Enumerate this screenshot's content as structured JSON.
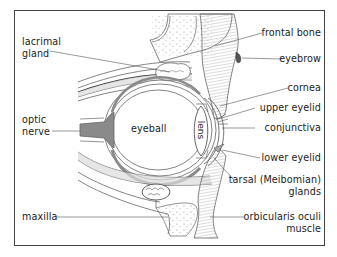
{
  "diagram": {
    "labels_left": [
      {
        "id": "lacrimal-gland",
        "line1": "lacrimal",
        "line2": "gland"
      },
      {
        "id": "optic-nerve",
        "line1": "optic",
        "line2": "nerve"
      },
      {
        "id": "maxilla",
        "line1": "maxilla"
      }
    ],
    "labels_right": [
      {
        "id": "frontal-bone",
        "line1": "frontal bone"
      },
      {
        "id": "eyebrow",
        "line1": "eyebrow"
      },
      {
        "id": "cornea",
        "line1": "cornea"
      },
      {
        "id": "upper-eyelid",
        "line1": "upper eyelid"
      },
      {
        "id": "conjunctiva",
        "line1": "conjunctiva"
      },
      {
        "id": "lower-eyelid",
        "line1": "lower eyelid"
      },
      {
        "id": "tarsal-glands",
        "line1": "tarsal (Meibomian)",
        "line2": "glands"
      },
      {
        "id": "orbicularis-oculi-muscle",
        "line1": "orbicularis oculi",
        "line2": "muscle"
      }
    ],
    "labels_inner": [
      {
        "id": "eyeball",
        "text": "eyeball"
      },
      {
        "id": "lens",
        "text": "lens"
      }
    ]
  },
  "colors": {
    "frame": "#444444",
    "line": "#555555",
    "tissue_gray": "#8a8a8a",
    "tissue_light": "#dcdcdc",
    "text": "#222222"
  }
}
